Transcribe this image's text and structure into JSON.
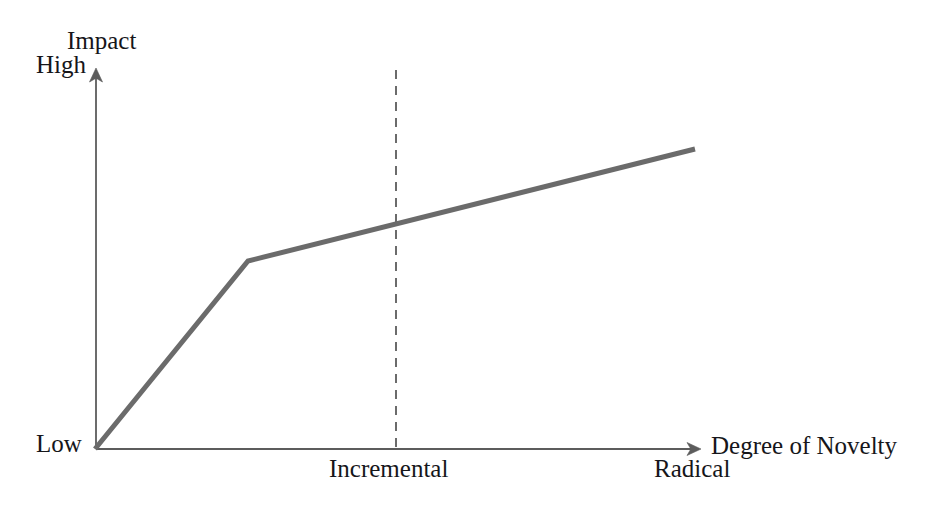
{
  "figure": {
    "width": 942,
    "height": 513,
    "background": "#ffffff"
  },
  "axes": {
    "y": {
      "title": "Impact",
      "tick_high": "High",
      "tick_low": "Low"
    },
    "x": {
      "title": "Degree of Novelty",
      "tick_incremental": "Incremental",
      "tick_radical": "Radical"
    }
  },
  "colors": {
    "series_line": "#6b6b6b",
    "axis_line": "#5c5c5c",
    "divider_line": "#6b6b6b",
    "text": "#16161a",
    "background": "#ffffff"
  },
  "chart_data": {
    "type": "line",
    "title": "",
    "xlabel": "Degree of Novelty",
    "ylabel": "Impact",
    "xlim": [
      0,
      1
    ],
    "ylim": [
      0,
      1
    ],
    "grid": false,
    "legend": null,
    "x_tick_labels": [
      "Incremental",
      "Radical"
    ],
    "x_tick_values": [
      0.5,
      0.93
    ],
    "y_tick_labels": [
      "Low",
      "High"
    ],
    "y_tick_values": [
      0,
      1
    ],
    "series": [
      {
        "name": "Impact vs Novelty",
        "line_color": "#6b6b6b",
        "line_width": 5,
        "x": [
          0.0,
          0.253,
          0.993
        ],
        "y": [
          0.0,
          0.496,
          0.792
        ],
        "points_px": [
          {
            "x": 95,
            "y": 449
          },
          {
            "x": 248,
            "y": 261
          },
          {
            "x": 695,
            "y": 149
          }
        ],
        "annotation": "Steep rise for low novelty, then a flatter gradual rise toward radical novelty"
      }
    ],
    "annotations": [
      {
        "type": "vertical-dashed-line",
        "label": "Incremental",
        "x": 0.497,
        "x_px": 396,
        "y_top_px": 70,
        "y_bottom_px": 449,
        "color": "#6b6b6b",
        "dash": "9 7"
      }
    ]
  }
}
